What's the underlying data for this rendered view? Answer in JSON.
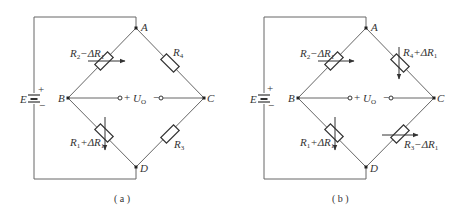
{
  "diagrams": [
    {
      "id": "a",
      "caption": "( a )",
      "nodes": {
        "A": "A",
        "B": "B",
        "C": "C",
        "D": "D"
      },
      "source": {
        "label": "E",
        "plus": "+",
        "minus": "−"
      },
      "output": {
        "plus": "+",
        "minus": "−",
        "label": "U",
        "label_sub": "O"
      },
      "resistors": {
        "AB": {
          "base": "R",
          "base_sub": "2",
          "delta": "−ΔR",
          "delta_sub": "1",
          "variable": true
        },
        "AC": {
          "base": "R",
          "base_sub": "4",
          "delta": "",
          "delta_sub": "",
          "variable": false
        },
        "BD": {
          "base": "R",
          "base_sub": "1",
          "delta": "+ΔR",
          "delta_sub": "1",
          "variable": true
        },
        "CD": {
          "base": "R",
          "base_sub": "3",
          "delta": "",
          "delta_sub": "",
          "variable": false
        }
      }
    },
    {
      "id": "b",
      "caption": "( b )",
      "nodes": {
        "A": "A",
        "B": "B",
        "C": "C",
        "D": "D"
      },
      "source": {
        "label": "E",
        "plus": "+",
        "minus": "−"
      },
      "output": {
        "plus": "+",
        "minus": "−",
        "label": "U",
        "label_sub": "O"
      },
      "resistors": {
        "AB": {
          "base": "R",
          "base_sub": "2",
          "delta": "−ΔR",
          "delta_sub": "1",
          "variable": true
        },
        "AC": {
          "base": "R",
          "base_sub": "4",
          "delta": "+ΔR",
          "delta_sub": "1",
          "variable": true
        },
        "BD": {
          "base": "R",
          "base_sub": "1",
          "delta": "+ΔR",
          "delta_sub": "1",
          "variable": true
        },
        "CD": {
          "base": "R",
          "base_sub": "3",
          "delta": "−ΔR",
          "delta_sub": "1",
          "variable": true
        }
      }
    }
  ]
}
